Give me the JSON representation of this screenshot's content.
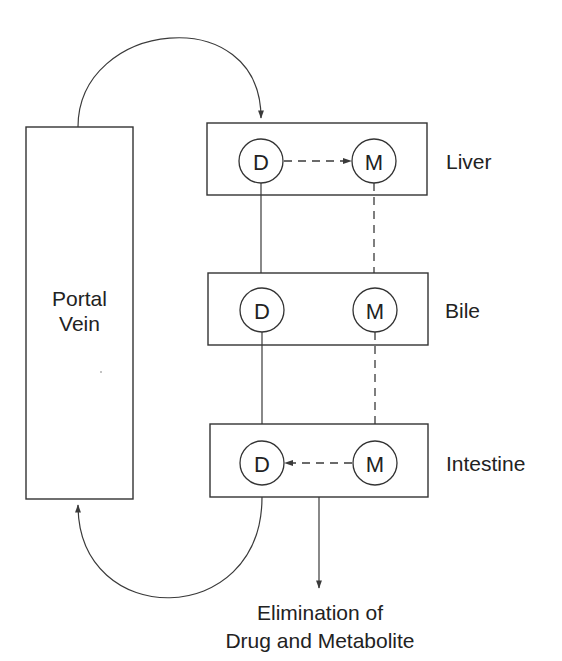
{
  "diagram": {
    "title": "",
    "portal_vein": {
      "line1": "Portal",
      "line2": "Vein"
    },
    "compartments": [
      {
        "id": "liver",
        "label": "Liver",
        "nodes": [
          {
            "id": "D",
            "label": "D"
          },
          {
            "id": "M",
            "label": "M"
          }
        ]
      },
      {
        "id": "bile",
        "label": "Bile",
        "nodes": [
          {
            "id": "D",
            "label": "D"
          },
          {
            "id": "M",
            "label": "M"
          }
        ]
      },
      {
        "id": "intestine",
        "label": "Intestine",
        "nodes": [
          {
            "id": "D",
            "label": "D"
          },
          {
            "id": "M",
            "label": "M"
          }
        ]
      }
    ],
    "edges": [
      {
        "from": "portal_vein",
        "to": "liver.D",
        "style": "solid-curved"
      },
      {
        "from": "liver.D",
        "to": "liver.M",
        "style": "dashed"
      },
      {
        "from": "liver.D",
        "to": "bile.D",
        "style": "solid"
      },
      {
        "from": "liver.M",
        "to": "bile.M",
        "style": "dashed"
      },
      {
        "from": "bile.D",
        "to": "intestine.D",
        "style": "solid"
      },
      {
        "from": "bile.M",
        "to": "intestine.M",
        "style": "dashed"
      },
      {
        "from": "intestine.M",
        "to": "intestine.D",
        "style": "dashed"
      },
      {
        "from": "intestine.D",
        "to": "portal_vein",
        "style": "solid-curved"
      },
      {
        "from": "intestine",
        "to": "elimination",
        "style": "solid"
      }
    ],
    "elimination": {
      "line1": "Elimination of",
      "line2": "Drug and Metabolite"
    }
  }
}
